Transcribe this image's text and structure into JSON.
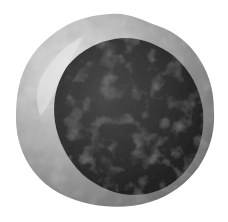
{
  "image": {
    "subject": "3D rendered cell with large dark nucleus",
    "background": "#ffffff",
    "colors": {
      "cytoplasm_light": "#d8d8d8",
      "cytoplasm_mid": "#9a9a9a",
      "cytoplasm_dark": "#6a6a6a",
      "nucleus_dark": "#1e1e1e",
      "nucleus_mid": "#3c3c3c",
      "nucleus_light": "#555555"
    }
  }
}
